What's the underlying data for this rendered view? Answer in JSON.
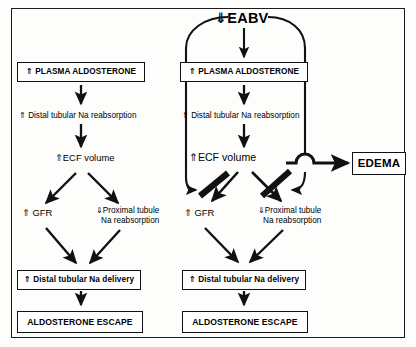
{
  "figure": {
    "border_color": "#111111",
    "background": "#fdfdfc"
  },
  "diagram": {
    "top_title": "⇓EABV",
    "top_title_plain": "EABV",
    "top_title_arrow": "down-double",
    "left_panel": {
      "name": "normal-pathway",
      "nodes": {
        "plasma_aldosterone": "⇑ PLASMA ALDOSTERONE",
        "distal_reabsorption": "⇑ Distal tubular Na reabsorption",
        "ecf_volume": "⇑ECF volume",
        "gfr": "⇑ GFR",
        "proximal_line1": "⇓Proximal tubule",
        "proximal_line2": "Na reabsorption",
        "distal_delivery": "⇑ Distal tubular Na delivery",
        "aldosterone_escape": "ALDOSTERONE ESCAPE"
      }
    },
    "right_panel": {
      "name": "reduced-eabv-pathway",
      "nodes": {
        "plasma_aldosterone": "⇑ PLASMA ALDOSTERONE",
        "distal_reabsorption": "⇑ Distal tubular Na reabsorption",
        "ecf_volume": "⇑ECF volume",
        "edema": "EDEMA",
        "gfr": "⇑ GFR",
        "proximal_line1": "⇓Proximal tubule",
        "proximal_line2": "Na reabsorption",
        "distal_delivery": "⇑ Distal tubular Na delivery",
        "aldosterone_escape": "ALDOSTERONE ESCAPE"
      },
      "blocked_arrows": [
        {
          "name": "blocked-gfr-arrow",
          "meaning": "increase in GFR is blocked"
        },
        {
          "name": "blocked-proximal-arrow",
          "meaning": "decrease in proximal tubular Na reabsorption is blocked"
        }
      ],
      "feedback_loops": [
        {
          "name": "eabv-left-feedback",
          "from": "EABV",
          "to": "blocked-gfr-arrow"
        },
        {
          "name": "eabv-right-feedback",
          "from": "EABV",
          "to": "blocked-proximal-arrow"
        }
      ]
    }
  }
}
